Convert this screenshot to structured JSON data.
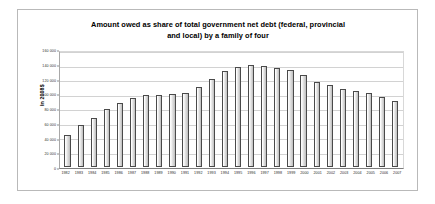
{
  "chart_data": {
    "type": "bar",
    "title": "Amount owed as share of total government net debt (federal, provincial and local) by a family of four",
    "title_line1": "Amount owed as share of total government net debt (federal, provincial",
    "title_line2": "and local) by a family of four",
    "xlabel": "",
    "ylabel": "In 2008$",
    "ylim": [
      0,
      160000
    ],
    "ytick_step": 20000,
    "ytick_labels": [
      "160 000",
      "140 000",
      "120 000",
      "100 000",
      "80 000",
      "60 000",
      "40 000",
      "20 000",
      "0"
    ],
    "ytick_values": [
      160000,
      140000,
      120000,
      100000,
      80000,
      60000,
      40000,
      20000,
      0
    ],
    "grid": true,
    "legend": false,
    "categories": [
      "1982",
      "1983",
      "1984",
      "1985",
      "1986",
      "1987",
      "1988",
      "1989",
      "1990",
      "1991",
      "1992",
      "1993",
      "1994",
      "1995",
      "1996",
      "1997",
      "1998",
      "1999",
      "2000",
      "2001",
      "2002",
      "2003",
      "2004",
      "2005",
      "2006",
      "2007"
    ],
    "values": [
      45500,
      58500,
      68500,
      81000,
      90500,
      96500,
      101000,
      101500,
      103000,
      104500,
      112500,
      123500,
      134500,
      140500,
      143000,
      142000,
      139500,
      135500,
      128500,
      119000,
      114500,
      110000,
      107000,
      103500,
      98500,
      93000
    ],
    "bar_fill_color": "#dcdcdc",
    "bar_border_color": "#4a4a4a",
    "grid_color": "#d2d2d2",
    "frame_color": "#b9b9b9",
    "background_color": "#ffffff"
  }
}
